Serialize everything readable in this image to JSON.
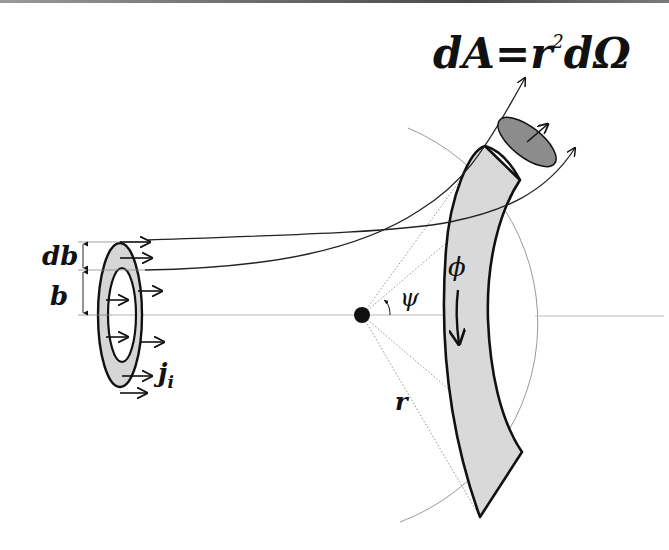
{
  "figure": {
    "title_formula": {
      "dA": "dA",
      "equals": "=",
      "r": "r",
      "sup": "2",
      "dOmega": "dΩ"
    },
    "labels": {
      "db": "db",
      "b": "b",
      "j": "j",
      "j_sub": "i",
      "phi": "ϕ",
      "psi": "ψ",
      "r": "r"
    },
    "colors": {
      "stroke": "#111111",
      "band_fill": "#d9d9d9",
      "ring_fill": "#d6d6d6",
      "patch_fill": "#8c8c8c",
      "axis": "#b0b0b0",
      "circle": "#9a9a9a"
    },
    "elements": [
      "incident-ring",
      "scattering-center",
      "detector-band",
      "area-patch",
      "reference-sphere",
      "trajectories"
    ]
  }
}
